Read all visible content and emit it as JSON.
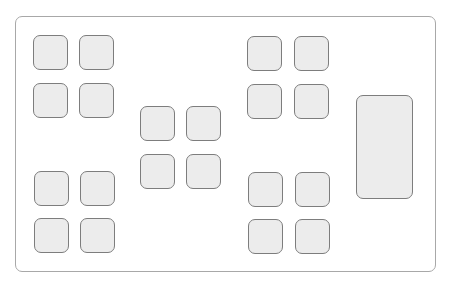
{
  "diagram": {
    "type": "button-layout-wireframe",
    "colors": {
      "background": "#ffffff",
      "frame_border": "#a8a8a8",
      "key_fill": "#ececec",
      "key_border": "#7d7d7d"
    },
    "frame": {
      "x": 15,
      "y": 16,
      "w": 421,
      "h": 256
    },
    "keys": [
      {
        "id": "tl-1",
        "cluster": "top-left",
        "x": 33,
        "y": 35,
        "w": 35,
        "h": 35,
        "label": ""
      },
      {
        "id": "tl-2",
        "cluster": "top-left",
        "x": 79,
        "y": 35,
        "w": 35,
        "h": 35,
        "label": ""
      },
      {
        "id": "tl-3",
        "cluster": "top-left",
        "x": 33,
        "y": 83,
        "w": 35,
        "h": 35,
        "label": ""
      },
      {
        "id": "tl-4",
        "cluster": "top-left",
        "x": 79,
        "y": 83,
        "w": 35,
        "h": 35,
        "label": ""
      },
      {
        "id": "c-1",
        "cluster": "center",
        "x": 140,
        "y": 106,
        "w": 35,
        "h": 35,
        "label": ""
      },
      {
        "id": "c-2",
        "cluster": "center",
        "x": 186,
        "y": 106,
        "w": 35,
        "h": 35,
        "label": ""
      },
      {
        "id": "c-3",
        "cluster": "center",
        "x": 140,
        "y": 154,
        "w": 35,
        "h": 35,
        "label": ""
      },
      {
        "id": "c-4",
        "cluster": "center",
        "x": 186,
        "y": 154,
        "w": 35,
        "h": 35,
        "label": ""
      },
      {
        "id": "tr-1",
        "cluster": "top-right",
        "x": 247,
        "y": 36,
        "w": 35,
        "h": 35,
        "label": ""
      },
      {
        "id": "tr-2",
        "cluster": "top-right",
        "x": 294,
        "y": 36,
        "w": 35,
        "h": 35,
        "label": ""
      },
      {
        "id": "tr-3",
        "cluster": "top-right",
        "x": 247,
        "y": 84,
        "w": 35,
        "h": 35,
        "label": ""
      },
      {
        "id": "tr-4",
        "cluster": "top-right",
        "x": 294,
        "y": 84,
        "w": 35,
        "h": 35,
        "label": ""
      },
      {
        "id": "bl-1",
        "cluster": "bottom-left",
        "x": 34,
        "y": 171,
        "w": 35,
        "h": 35,
        "label": ""
      },
      {
        "id": "bl-2",
        "cluster": "bottom-left",
        "x": 80,
        "y": 171,
        "w": 35,
        "h": 35,
        "label": ""
      },
      {
        "id": "bl-3",
        "cluster": "bottom-left",
        "x": 34,
        "y": 218,
        "w": 35,
        "h": 35,
        "label": ""
      },
      {
        "id": "bl-4",
        "cluster": "bottom-left",
        "x": 80,
        "y": 218,
        "w": 35,
        "h": 35,
        "label": ""
      },
      {
        "id": "br-1",
        "cluster": "bottom-right",
        "x": 248,
        "y": 172,
        "w": 35,
        "h": 35,
        "label": ""
      },
      {
        "id": "br-2",
        "cluster": "bottom-right",
        "x": 295,
        "y": 172,
        "w": 35,
        "h": 35,
        "label": ""
      },
      {
        "id": "br-3",
        "cluster": "bottom-right",
        "x": 248,
        "y": 219,
        "w": 35,
        "h": 35,
        "label": ""
      },
      {
        "id": "br-4",
        "cluster": "bottom-right",
        "x": 295,
        "y": 219,
        "w": 35,
        "h": 35,
        "label": ""
      },
      {
        "id": "tall-1",
        "cluster": "right",
        "x": 356,
        "y": 95,
        "w": 57,
        "h": 104,
        "label": ""
      }
    ]
  }
}
